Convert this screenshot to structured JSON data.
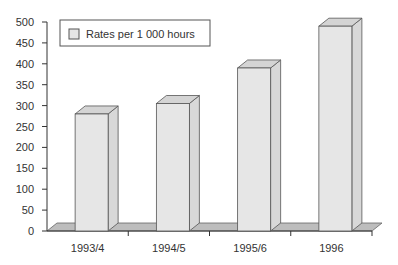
{
  "chart_data": {
    "type": "bar",
    "title": "",
    "xlabel": "",
    "ylabel": "",
    "categories": [
      "1993/4",
      "1994/5",
      "1995/6",
      "1996"
    ],
    "series": [
      {
        "name": "Rates per 1 000 hours",
        "values": [
          280,
          305,
          390,
          490
        ]
      }
    ],
    "ylim": [
      0,
      500
    ],
    "yticks": [
      0,
      50,
      100,
      150,
      200,
      250,
      300,
      350,
      400,
      450,
      500
    ],
    "grid": false,
    "legend_position": "top-left",
    "style": "3d"
  },
  "colors": {
    "bar_front": "#e6e6e6",
    "bar_side": "#d8d8d8",
    "bar_top": "#d4d4d4",
    "floor": "#bdbdbd",
    "axis": "#333333"
  },
  "legend": {
    "label": "Rates per 1 000 hours"
  },
  "axis": {
    "y_labels": [
      "0",
      "50",
      "100",
      "150",
      "200",
      "250",
      "300",
      "350",
      "400",
      "450",
      "500"
    ],
    "x_labels": [
      "1993/4",
      "1994/5",
      "1995/6",
      "1996"
    ]
  }
}
